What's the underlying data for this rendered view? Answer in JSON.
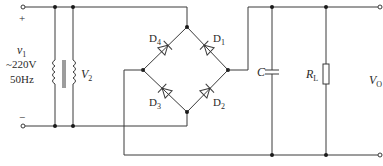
{
  "diagram": {
    "type": "bridge-rectifier-capacitor-filter",
    "input": {
      "plus_label": "+",
      "minus_label": "−",
      "source_symbol": "v",
      "source_sub": "1",
      "voltage": "~220V",
      "frequency": "50Hz"
    },
    "transformer": {
      "secondary_symbol": "V",
      "secondary_sub": "2"
    },
    "diodes": [
      {
        "id": "D1",
        "letter": "D",
        "sub": "1"
      },
      {
        "id": "D2",
        "letter": "D",
        "sub": "2"
      },
      {
        "id": "D3",
        "letter": "D",
        "sub": "3"
      },
      {
        "id": "D4",
        "letter": "D",
        "sub": "4"
      }
    ],
    "capacitor": {
      "label": "C"
    },
    "load": {
      "letter": "R",
      "sub": "L"
    },
    "output": {
      "letter": "V",
      "sub": "O"
    },
    "colors": {
      "line": "#3a3a3a",
      "node": "#1a1a1a",
      "background": "#ffffff"
    }
  }
}
